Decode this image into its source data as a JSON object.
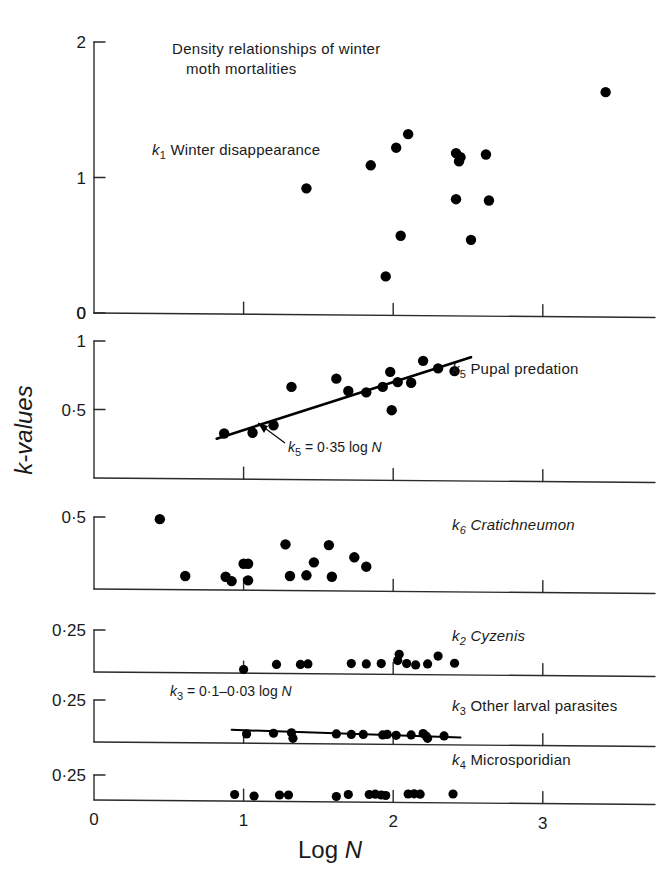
{
  "figure": {
    "title_line1": "Density relationships of winter",
    "title_line2": "moth mortalities",
    "y_axis_label": "k-values",
    "x_axis_label": "Log N",
    "x_tick_labels": [
      "0",
      "1",
      "2",
      "3"
    ],
    "ink_color": "#000000"
  },
  "chart_data": {
    "type": "scatter",
    "xlabel": "Log N",
    "ylabel": "k-values",
    "xlim": [
      0,
      3.75
    ],
    "grid": false,
    "legend": "none",
    "panels": [
      {
        "key": "k1",
        "label_k": "k",
        "label_sub": "1",
        "label_text": "Winter disappearance",
        "label_italic": false,
        "ylim": [
          0,
          2
        ],
        "y_ticks": [
          0,
          1,
          2
        ],
        "y_tick_labels": [
          "0",
          "1",
          "2"
        ],
        "x": [
          1.42,
          1.85,
          2.02,
          2.1,
          2.42,
          2.44,
          2.45,
          2.62,
          2.42,
          2.64,
          2.05,
          2.52,
          1.95,
          3.42
        ],
        "y": [
          0.92,
          1.09,
          1.22,
          1.32,
          1.18,
          1.12,
          1.15,
          1.17,
          0.84,
          0.83,
          0.57,
          0.54,
          0.27,
          1.63
        ],
        "fit": null
      },
      {
        "key": "k5",
        "label_k": "k",
        "label_sub": "5",
        "label_text": "Pupal predation",
        "label_italic": false,
        "ylim": [
          0,
          1
        ],
        "y_ticks": [
          0.5,
          1
        ],
        "y_tick_labels": [
          "0.5",
          "1"
        ],
        "x": [
          0.87,
          1.06,
          1.2,
          1.32,
          1.62,
          1.7,
          1.82,
          1.93,
          1.98,
          2.03,
          2.12,
          2.2,
          2.3,
          2.41,
          1.99
        ],
        "y": [
          0.325,
          0.33,
          0.385,
          0.665,
          0.725,
          0.635,
          0.625,
          0.665,
          0.775,
          0.7,
          0.695,
          0.855,
          0.8,
          0.78,
          0.495
        ],
        "fit": {
          "equation_k": "k",
          "equation_sub": "5",
          "equation_rest": " = 0·0 35 log N",
          "equation_display": "= 0·35 log",
          "equation_var": "N",
          "slope": 0.35,
          "intercept": 0.0,
          "x_start": 0.82,
          "x_end": 2.52
        }
      },
      {
        "key": "k6",
        "label_k": "k",
        "label_sub": "6",
        "label_text": "Cratichneumon",
        "label_italic": true,
        "ylim": [
          0,
          0.5
        ],
        "y_ticks": [
          0.5
        ],
        "y_tick_labels": [
          "0.5"
        ],
        "x": [
          0.44,
          0.61,
          0.88,
          0.92,
          1.0,
          1.03,
          1.03,
          1.28,
          1.31,
          1.42,
          1.47,
          1.57,
          1.59,
          1.74,
          1.82
        ],
        "y": [
          0.485,
          0.09,
          0.085,
          0.055,
          0.175,
          0.175,
          0.06,
          0.31,
          0.09,
          0.095,
          0.185,
          0.305,
          0.085,
          0.22,
          0.155
        ],
        "fit": null
      },
      {
        "key": "k2",
        "label_k": "k",
        "label_sub": "2",
        "label_text": "Cyzenis",
        "label_italic": true,
        "ylim": [
          0,
          0.25
        ],
        "y_ticks": [
          0.25
        ],
        "y_tick_labels": [
          "0.25"
        ],
        "x": [
          1.0,
          1.22,
          1.38,
          1.43,
          1.72,
          1.82,
          1.92,
          2.03,
          2.04,
          2.09,
          2.15,
          2.23,
          2.3,
          2.41
        ],
        "y": [
          0.015,
          0.045,
          0.045,
          0.048,
          0.05,
          0.048,
          0.05,
          0.068,
          0.105,
          0.05,
          0.042,
          0.048,
          0.095,
          0.052
        ],
        "fit": null
      },
      {
        "key": "k3",
        "label_k": "k",
        "label_sub": "3",
        "label_text": "Other larval parasites",
        "label_italic": false,
        "ylim": [
          0,
          0.25
        ],
        "y_ticks": [
          0.25
        ],
        "y_tick_labels": [
          "0.25"
        ],
        "x": [
          1.02,
          1.2,
          1.32,
          1.33,
          1.62,
          1.72,
          1.8,
          1.93,
          1.96,
          2.02,
          2.12,
          2.2,
          2.22,
          2.23,
          2.34
        ],
        "y": [
          0.048,
          0.052,
          0.055,
          0.022,
          0.048,
          0.045,
          0.045,
          0.042,
          0.045,
          0.04,
          0.042,
          0.05,
          0.035,
          0.022,
          0.036
        ],
        "fit": {
          "equation_k": "k",
          "equation_sub": "3",
          "equation_display": "= 0·1–0·03 log",
          "equation_var": "N",
          "slope": -0.03,
          "intercept": 0.1,
          "x_start": 0.92,
          "x_end": 2.45
        }
      },
      {
        "key": "k4",
        "label_k": "k",
        "label_sub": "4",
        "label_text": "Microsporidian",
        "label_italic": false,
        "ylim": [
          0,
          0.25
        ],
        "y_ticks": [
          0.25
        ],
        "y_tick_labels": [
          "0.25"
        ],
        "x": [
          0.94,
          1.07,
          1.24,
          1.3,
          1.62,
          1.7,
          1.84,
          1.88,
          1.92,
          1.95,
          2.1,
          2.14,
          2.18,
          2.4
        ],
        "y": [
          0.055,
          0.04,
          0.05,
          0.05,
          0.035,
          0.055,
          0.055,
          0.058,
          0.05,
          0.045,
          0.06,
          0.062,
          0.058,
          0.06
        ],
        "fit": null
      }
    ]
  }
}
